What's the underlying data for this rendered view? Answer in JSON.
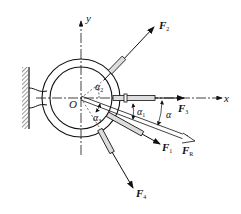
{
  "diagram": {
    "type": "force-diagram",
    "origin_label": "O",
    "axes": {
      "x": "x",
      "y": "y"
    },
    "forces": [
      {
        "name": "F",
        "sub": "1"
      },
      {
        "name": "F",
        "sub": "2"
      },
      {
        "name": "F",
        "sub": "3"
      },
      {
        "name": "F",
        "sub": "4"
      },
      {
        "name": "F",
        "sub": "R"
      }
    ],
    "angles": [
      {
        "name": "α",
        "sub": "1"
      },
      {
        "name": "α",
        "sub": "2"
      },
      {
        "name": "α",
        "sub": "3"
      },
      {
        "name": "α",
        "sub": ""
      }
    ]
  }
}
